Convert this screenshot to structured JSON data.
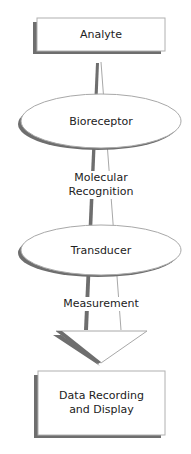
{
  "diagram": {
    "type": "flowchart",
    "direction": "top-to-bottom",
    "nodes": [
      {
        "id": "analyte",
        "shape": "rectangle",
        "label": "Analyte"
      },
      {
        "id": "bioreceptor",
        "shape": "ellipse",
        "label": "Bioreceptor"
      },
      {
        "id": "transducer",
        "shape": "ellipse",
        "label": "Transducer"
      },
      {
        "id": "data",
        "shape": "rectangle",
        "label_line1": "Data Recording",
        "label_line2": "and Display"
      }
    ],
    "edge_labels": {
      "recognition_line1": "Molecular",
      "recognition_line2": "Recognition",
      "measurement": "Measurement"
    },
    "colors": {
      "fill": "#ffffff",
      "stroke": "#b0b0b0",
      "shadow": "#6e6e6e",
      "text": "#222222"
    }
  }
}
